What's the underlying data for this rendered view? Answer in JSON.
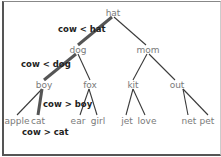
{
  "diagram": {
    "type": "binary-search-tree",
    "search_key": "cow",
    "nodes": {
      "root": "hat",
      "l": "dog",
      "r": "mom",
      "ll": "boy",
      "lr": "fox",
      "rl": "kit",
      "rr": "out",
      "lll": "apple",
      "llr": "cat",
      "lrl": "ear",
      "lrr": "girl",
      "rll": "jet",
      "rlr": "love",
      "rrl": "net",
      "rrr": "pet"
    },
    "comparisons": {
      "c1": "cow < hat",
      "c2": "cow < dog",
      "c3": "cow > boy",
      "c4": "cow > cat"
    },
    "highlighted_path": [
      "hat",
      "dog",
      "boy",
      "cat"
    ],
    "colors": {
      "node_text": "#7a7a7a",
      "comparison_text": "#222222",
      "edge": "#3a3a3a",
      "search_path_edge": "#555555"
    }
  }
}
